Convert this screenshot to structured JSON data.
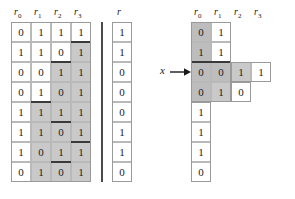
{
  "figure": {
    "caption": "",
    "colors": {
      "shaded_cell": "#c9c9c9",
      "shaded_cell_dark": "#bdbdbd",
      "cell_border": "#b9b9b9",
      "heavy_rule": "#3a3a3a",
      "text": "#1a1a1a",
      "background": "#ffffff"
    }
  },
  "left_table": {
    "headers": [
      "r0",
      "r1",
      "r2",
      "r3"
    ],
    "header_labels": [
      "r",
      "r",
      "r",
      "r"
    ],
    "header_subs": [
      "0",
      "1",
      "2",
      "3"
    ],
    "rows": [
      {
        "cells": [
          "0",
          "1",
          "1",
          "1"
        ],
        "shaded": [
          false,
          false,
          false,
          false
        ]
      },
      {
        "cells": [
          "1",
          "1",
          "0",
          "1"
        ],
        "shaded": [
          false,
          false,
          false,
          true
        ]
      },
      {
        "cells": [
          "0",
          "0",
          "1",
          "1"
        ],
        "shaded": [
          false,
          false,
          true,
          true
        ]
      },
      {
        "cells": [
          "0",
          "1",
          "0",
          "1"
        ],
        "shaded": [
          false,
          false,
          true,
          true
        ]
      },
      {
        "cells": [
          "1",
          "1",
          "1",
          "1"
        ],
        "shaded": [
          false,
          true,
          true,
          true
        ]
      },
      {
        "cells": [
          "1",
          "1",
          "0",
          "1"
        ],
        "shaded": [
          false,
          true,
          true,
          true
        ]
      },
      {
        "cells": [
          "1",
          "0",
          "1",
          "1"
        ],
        "shaded": [
          false,
          true,
          true,
          true
        ]
      },
      {
        "cells": [
          "0",
          "1",
          "0",
          "1"
        ],
        "shaded": [
          false,
          true,
          true,
          true
        ]
      }
    ]
  },
  "r_column": {
    "header": "r",
    "values": [
      "1",
      "1",
      "0",
      "0",
      "0",
      "1",
      "1",
      "0"
    ]
  },
  "right_table": {
    "headers": [
      "r0",
      "r1",
      "r2",
      "r3"
    ],
    "header_labels": [
      "r",
      "r",
      "r",
      "r"
    ],
    "header_subs": [
      "0",
      "1",
      "2",
      "3"
    ],
    "rows": [
      {
        "cells": [
          "0",
          "1"
        ],
        "shaded": [
          true,
          false
        ]
      },
      {
        "cells": [
          "1",
          "1"
        ],
        "shaded": [
          true,
          false
        ]
      },
      {
        "cells": [
          "0",
          "0",
          "1",
          "1"
        ],
        "shaded": [
          true,
          true,
          true,
          false
        ]
      },
      {
        "cells": [
          "0",
          "1",
          "0"
        ],
        "shaded": [
          true,
          true,
          false
        ]
      },
      {
        "cells": [
          "1"
        ],
        "shaded": [
          false
        ]
      },
      {
        "cells": [
          "1"
        ],
        "shaded": [
          false
        ]
      },
      {
        "cells": [
          "1"
        ],
        "shaded": [
          false
        ]
      },
      {
        "cells": [
          "0"
        ],
        "shaded": [
          false
        ]
      }
    ]
  },
  "pointer": {
    "label": "x",
    "target_row": 3
  }
}
